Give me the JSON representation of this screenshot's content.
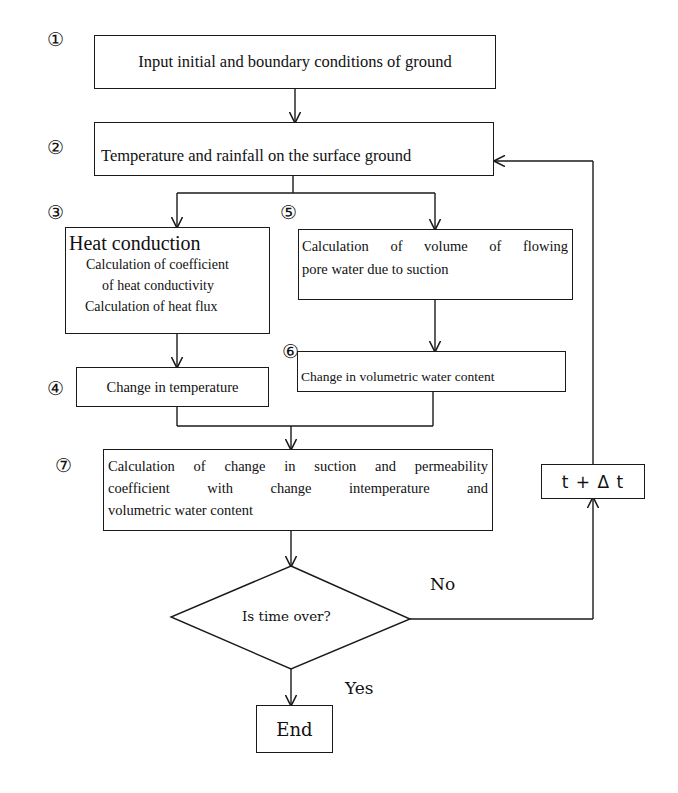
{
  "diagram": {
    "type": "flowchart",
    "step_numbers": {
      "s1": "①",
      "s2": "②",
      "s3": "③",
      "s4": "④",
      "s5": "⑤",
      "s6": "⑥",
      "s7": "⑦"
    },
    "nodes": {
      "input": {
        "label": "Input initial and boundary conditions of ground"
      },
      "surface": {
        "label": "Temperature and rainfall on the surface ground"
      },
      "heat": {
        "title": "Heat conduction",
        "line1": "Calculation of coefficient",
        "line2": "of heat conductivity",
        "line3": "Calculation of heat flux"
      },
      "pore_water": {
        "line1": "Calculation of volume of flowing",
        "line2": "pore water due to suction"
      },
      "temp_change": {
        "label": "Change in temperature"
      },
      "water_change": {
        "label": "Change in volumetric water content"
      },
      "suction": {
        "line1": "Calculation of change in suction and permeability",
        "line2": "coefficient with change intemperature and",
        "line3": "volumetric water content"
      },
      "decision": {
        "label": "Is time over?"
      },
      "end": {
        "label": "End"
      },
      "increment": {
        "label": "t + Δ t"
      }
    },
    "edges": {
      "no_label": "No",
      "yes_label": "Yes"
    },
    "colors": {
      "line": "#1a1a1a",
      "background": "#ffffff"
    }
  }
}
